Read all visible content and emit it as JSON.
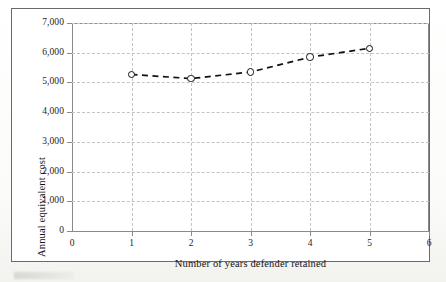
{
  "figure": {
    "background_color": "#ffffff",
    "frame_color": "#6a6a6a"
  },
  "chart_data": {
    "type": "line",
    "title": "",
    "subtitle": "",
    "xlabel": "Number of years defender retained",
    "ylabel": "Annual equivalent cost",
    "x": [
      1,
      2,
      3,
      4,
      5
    ],
    "values": [
      5270,
      5130,
      5350,
      5850,
      6150
    ],
    "series": [
      {
        "name": "Annual equivalent cost",
        "x": [
          1,
          2,
          3,
          4,
          5
        ],
        "values": [
          5270,
          5130,
          5350,
          5850,
          6150
        ],
        "line_style": "dashed",
        "line_color": "#111111",
        "marker": "open-circle",
        "marker_color": "#111111"
      }
    ],
    "xlim": [
      0,
      6
    ],
    "ylim": [
      0,
      7000
    ],
    "xticks": [
      "0",
      "1",
      "2",
      "3",
      "4",
      "5",
      "6"
    ],
    "xtick_values": [
      0,
      1,
      2,
      3,
      4,
      5,
      6
    ],
    "yticks": [
      "0",
      "1,000",
      "2,000",
      "3,000",
      "4,000",
      "5,000",
      "6,000",
      "7,000"
    ],
    "ytick_values": [
      0,
      1000,
      2000,
      3000,
      4000,
      5000,
      6000,
      7000
    ],
    "grid": true,
    "grid_style": "dashed",
    "grid_color": "#c4c4c4",
    "legend": false,
    "legend_position": "none"
  }
}
